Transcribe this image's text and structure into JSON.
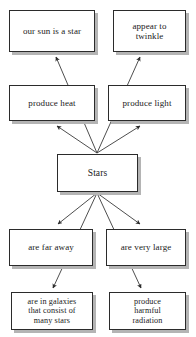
{
  "diagram": {
    "style": {
      "box_fill": "#ffffff",
      "box_border": "#2b2b2b",
      "box_shadow": "#b4b4b4",
      "edge_color": "#3a3a3a",
      "text_color": "#1a1a1a",
      "background": "#ffffff"
    },
    "nodes": {
      "sun": "our sun is a star",
      "twinkle": "appear to\ntwinkle",
      "heat": "produce heat",
      "light": "produce light",
      "stars": "Stars",
      "faraway": "are far away",
      "large": "are very large",
      "galaxies": "are in galaxies\nthat consist of\nmany stars",
      "harmful": "produce\nharmful\nradiation"
    },
    "edges": [
      {
        "from": "stars",
        "to": "heat"
      },
      {
        "from": "stars",
        "to": "light"
      },
      {
        "from": "stars",
        "to": "sun"
      },
      {
        "from": "stars",
        "to": "twinkle"
      },
      {
        "from": "stars",
        "to": "faraway"
      },
      {
        "from": "stars",
        "to": "large"
      },
      {
        "from": "stars",
        "to": "galaxies"
      },
      {
        "from": "stars",
        "to": "harmful"
      }
    ]
  }
}
